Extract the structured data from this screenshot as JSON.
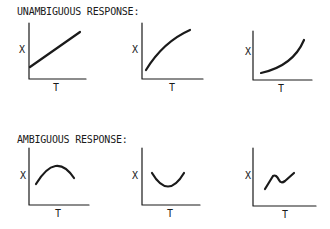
{
  "sections": [
    {
      "title": "UNAMBIGUOUS RESPONSE:",
      "panels": [
        {
          "x_axis_label": "T",
          "y_axis_label": "X",
          "curve": "linear increasing"
        },
        {
          "x_axis_label": "T",
          "y_axis_label": "X",
          "curve": "concave increasing"
        },
        {
          "x_axis_label": "T",
          "y_axis_label": "X",
          "curve": "convex increasing"
        }
      ]
    },
    {
      "title": "AMBIGUOUS RESPONSE:",
      "panels": [
        {
          "x_axis_label": "T",
          "y_axis_label": "X",
          "curve": "arch (rise then fall)"
        },
        {
          "x_axis_label": "T",
          "y_axis_label": "X",
          "curve": "U-shape (fall then rise)"
        },
        {
          "x_axis_label": "T",
          "y_axis_label": "X",
          "curve": "zigzag (rise, dip, rise)"
        }
      ]
    }
  ],
  "colors": {
    "ink": "#1a1a1a",
    "background": "#ffffff"
  }
}
